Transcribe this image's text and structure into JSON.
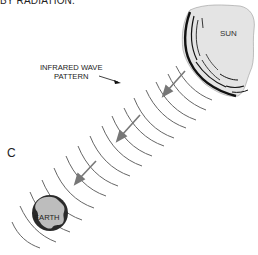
{
  "figure": {
    "caption_top": "BY RADIATION.",
    "panel_letter": "C",
    "labels": {
      "wave_line1": "INFRARED WAVE",
      "wave_line2": "PATTERN",
      "sun": "SUN",
      "earth": "EARTH"
    },
    "colors": {
      "sun_fill": "#e4e4e4",
      "sun_edge": "#111111",
      "wave_stroke": "#666666",
      "arrow_stroke": "#777777",
      "earth_dark": "#2a2a2a",
      "earth_land": "#bdbdbd"
    },
    "arrows_count": 3,
    "wave_arcs_count": 14
  }
}
